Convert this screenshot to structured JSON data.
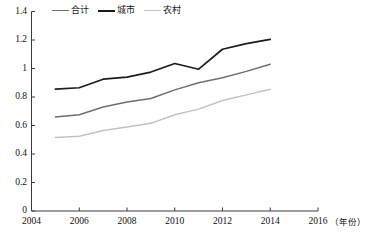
{
  "chart_data": {
    "type": "line",
    "title": "",
    "subtitle": "",
    "xlabel": "年份",
    "ylabel": "",
    "xlim": [
      2004,
      2016
    ],
    "ylim": [
      0,
      1.4
    ],
    "grid": false,
    "legend_position": "top-left",
    "x": [
      2005,
      2006,
      2007,
      2008,
      2009,
      2010,
      2011,
      2012,
      2013,
      2014
    ],
    "xticks": [
      "2004",
      "2006",
      "2008",
      "2010",
      "2012",
      "2014",
      "2016"
    ],
    "xtick_values": [
      2004,
      2006,
      2008,
      2010,
      2012,
      2014,
      2016
    ],
    "yticks": [
      "0",
      "0.2",
      "0.4",
      "0.6",
      "0.8",
      "1",
      "1.2",
      "1.4"
    ],
    "ytick_values": [
      0,
      0.2,
      0.4,
      0.6,
      0.8,
      1.0,
      1.2,
      1.4
    ],
    "series": [
      {
        "name": "合计",
        "color": "#6e6e6e",
        "width": 1.5,
        "values": [
          0.66,
          0.675,
          0.73,
          0.765,
          0.79,
          0.85,
          0.9,
          0.935,
          0.98,
          1.03
        ]
      },
      {
        "name": "城市",
        "color": "#1c1c1c",
        "width": 1.7,
        "values": [
          0.855,
          0.865,
          0.925,
          0.94,
          0.975,
          1.035,
          0.995,
          1.135,
          1.175,
          1.205
        ]
      },
      {
        "name": "农村",
        "color": "#c2c2c2",
        "width": 1.5,
        "values": [
          0.515,
          0.525,
          0.565,
          0.59,
          0.615,
          0.675,
          0.715,
          0.775,
          0.815,
          0.855
        ]
      }
    ],
    "annotations": []
  },
  "legend": {
    "items": [
      {
        "label": "合计",
        "color": "#6e6e6e"
      },
      {
        "label": "城市",
        "color": "#1c1c1c"
      },
      {
        "label": "农村",
        "color": "#c2c2c2"
      }
    ]
  },
  "axes": {
    "x_unit": "（年份）",
    "y_ticks": [
      "1.4",
      "1.2",
      "1",
      "0.8",
      "0.6",
      "0.4",
      "0.2",
      "0"
    ],
    "x_ticks": [
      "2004",
      "2006",
      "2008",
      "2010",
      "2012",
      "2014",
      "2016"
    ],
    "axis_color": "#3a3a3a"
  },
  "caption": {
    "text": ""
  }
}
